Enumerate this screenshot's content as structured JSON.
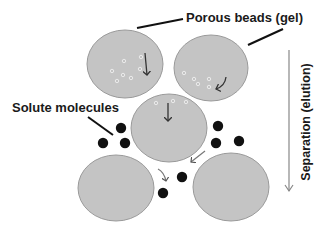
{
  "labels": {
    "porous_beads": "Porous beads (gel)",
    "solute_molecules": "Solute molecules",
    "separation": "Separation (elution)"
  },
  "colors": {
    "bead_fill": "#c4c4c4",
    "bead_stroke": "#9a9a9a",
    "solute": "#111111",
    "pore_ring": "#f2f2f2",
    "arrow": "#555555",
    "leader_line": "#111111"
  },
  "beads": [
    {
      "id": "bead-top-left",
      "cx": 125,
      "cy": 64,
      "rx": 38,
      "ry": 34
    },
    {
      "id": "bead-top-right",
      "cx": 211,
      "cy": 68,
      "rx": 37,
      "ry": 33
    },
    {
      "id": "bead-middle",
      "cx": 169,
      "cy": 128,
      "rx": 38,
      "ry": 34
    },
    {
      "id": "bead-bottom-left",
      "cx": 116,
      "cy": 188,
      "rx": 38,
      "ry": 33
    },
    {
      "id": "bead-bottom-right",
      "cx": 231,
      "cy": 187,
      "rx": 38,
      "ry": 34
    }
  ],
  "solute_molecules": [
    {
      "cx": 121,
      "cy": 128
    },
    {
      "cx": 103,
      "cy": 143
    },
    {
      "cx": 125,
      "cy": 143
    },
    {
      "cx": 218,
      "cy": 126
    },
    {
      "cx": 216,
      "cy": 143
    },
    {
      "cx": 239,
      "cy": 141
    },
    {
      "cx": 182,
      "cy": 177
    },
    {
      "cx": 163,
      "cy": 193
    }
  ],
  "small_molecules_in_pores": [
    {
      "cx": 124,
      "cy": 61
    },
    {
      "cx": 141,
      "cy": 57
    },
    {
      "cx": 112,
      "cy": 71
    },
    {
      "cx": 123,
      "cy": 75
    },
    {
      "cx": 131,
      "cy": 78
    },
    {
      "cx": 140,
      "cy": 69
    },
    {
      "cx": 117,
      "cy": 81
    },
    {
      "cx": 184,
      "cy": 73
    },
    {
      "cx": 194,
      "cy": 79
    },
    {
      "cx": 198,
      "cy": 84
    },
    {
      "cx": 209,
      "cy": 79
    },
    {
      "cx": 209,
      "cy": 87
    },
    {
      "cx": 156,
      "cy": 103
    },
    {
      "cx": 173,
      "cy": 101
    },
    {
      "cx": 186,
      "cy": 102
    }
  ]
}
